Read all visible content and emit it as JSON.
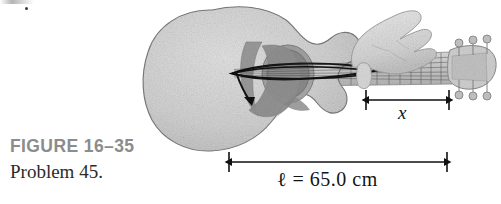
{
  "figure": {
    "caption_label": "FIGURE 16–35",
    "caption_problem": "Problem 45.",
    "caption_color": "#8c8c8c"
  },
  "dimensions": {
    "string_length": {
      "label": "ℓ = 65.0 cm",
      "symbol": "ℓ",
      "value": "65.0",
      "unit": "cm",
      "arrow_left_x": 229,
      "arrow_right_x": 447,
      "arrow_y": 162
    },
    "fret_distance": {
      "label": "x",
      "arrow_left_x": 366,
      "arrow_right_x": 449,
      "arrow_y": 100
    }
  },
  "guitar": {
    "body_fill": "#d2d2d2",
    "body_stroke": "#7a7a7a",
    "soundhole_fill": "#9a9a9a",
    "pickguard_fill": "#8f8f8f",
    "neck_fill": "#c9c9c9",
    "fret_stroke": "#6f6f6f",
    "string_envelope_fill": "#141414",
    "hand_fill": "#dcdcdc",
    "headstock_fill": "#cfcfcf",
    "tuning_peg_count": 6,
    "fret_count": 12,
    "string_count": 6,
    "pluck_arrow_color": "#101010"
  },
  "colors": {
    "ink": "#141414",
    "paper": "#ffffff",
    "caption_gray": "#8c8c8c"
  }
}
